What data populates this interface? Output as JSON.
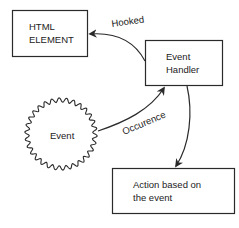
{
  "diagram": {
    "nodes": {
      "html_element": {
        "line1": "HTML",
        "line2": "ELEMENT"
      },
      "event_handler": {
        "line1": "Event",
        "line2": "Handler"
      },
      "event": {
        "label": "Event"
      },
      "action": {
        "line1": "Action based on",
        "line2": "the event"
      }
    },
    "edges": {
      "hooked": {
        "label": "Hooked",
        "from": "Event Handler",
        "to": "HTML ELEMENT"
      },
      "occurence": {
        "label": "Occurence",
        "from": "Event",
        "to": "Event Handler"
      },
      "action": {
        "label": "",
        "from": "Event Handler",
        "to": "Action based on the event"
      }
    },
    "colors": {
      "stroke": "#2a2a2a",
      "background": "#ffffff",
      "text": "#222222"
    }
  }
}
